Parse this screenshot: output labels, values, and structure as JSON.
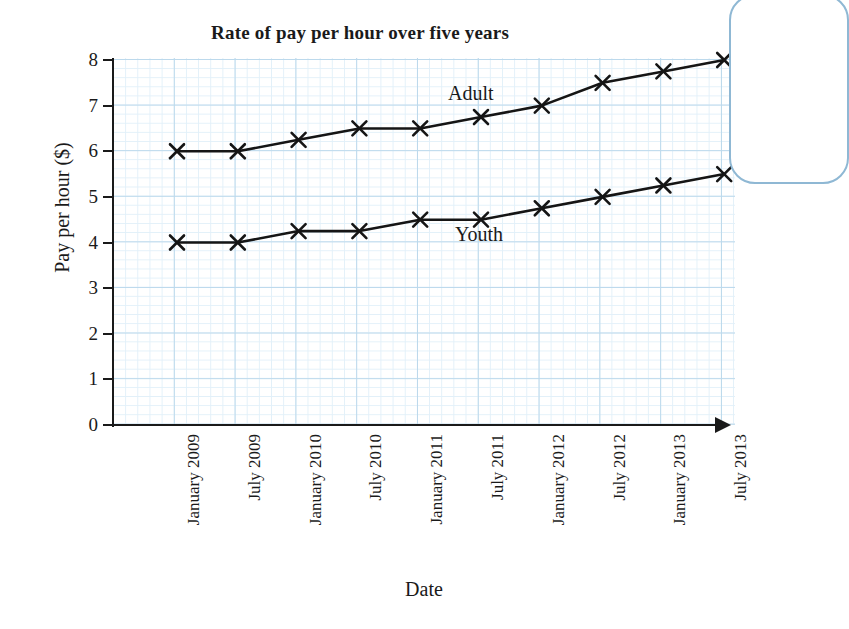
{
  "chart_data": {
    "type": "line",
    "title": "Rate of pay per hour over five years",
    "xlabel": "Date",
    "ylabel": "Pay per hour ($)",
    "categories": [
      "January 2009",
      "July 2009",
      "January 2010",
      "July 2010",
      "January 2011",
      "July 2011",
      "January 2012",
      "July 2012",
      "January 2013",
      "July 2013"
    ],
    "series": [
      {
        "name": "Adult",
        "values": [
          6.0,
          6.0,
          6.25,
          6.5,
          6.5,
          6.75,
          7.0,
          7.5,
          7.75,
          8.0
        ]
      },
      {
        "name": "Youth",
        "values": [
          4.0,
          4.0,
          4.25,
          4.25,
          4.5,
          4.5,
          4.75,
          5.0,
          5.25,
          5.5
        ]
      }
    ],
    "ylim": [
      0,
      8
    ],
    "y_ticks": [
      "0",
      "1",
      "2",
      "3",
      "4",
      "5",
      "6",
      "7",
      "8"
    ],
    "grid": true,
    "grid_color": "#bcd9ec",
    "legend_position": "inline-labels",
    "marker": "x-cross",
    "line_color": "#151515"
  },
  "annotations": {
    "adult_label": "Adult",
    "youth_label": "Youth"
  },
  "decoration": {
    "panel_border_color": "#8fb8d4"
  }
}
